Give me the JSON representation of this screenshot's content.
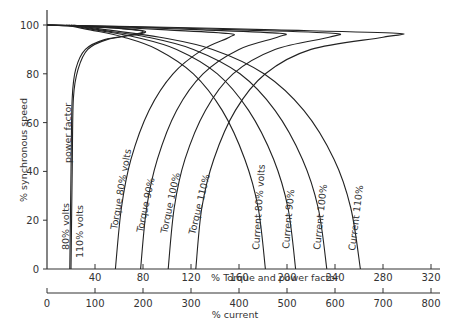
{
  "chart_data": {
    "type": "line",
    "title": "",
    "ylabel": "% synchronous speed",
    "xlabel": "% Torque and power factor",
    "xlabel2": "% current",
    "ylim": [
      0,
      100
    ],
    "xlim": [
      0,
      320
    ],
    "xlim2": [
      0,
      800
    ],
    "y_ticks": [
      "0",
      "20",
      "40",
      "60",
      "80",
      "100"
    ],
    "x_ticks": [
      "40",
      "80",
      "120",
      "160",
      "200",
      "240",
      "280",
      "320"
    ],
    "x2_ticks": [
      "0",
      "100",
      "200",
      "300",
      "400",
      "500",
      "600",
      "700",
      "800"
    ],
    "grid": false,
    "series": [
      {
        "name": "power factor 80% volts",
        "label": "80% volts",
        "axis": "torque",
        "points": [
          [
            19,
            0
          ],
          [
            20,
            40
          ],
          [
            21,
            70
          ],
          [
            24,
            82
          ],
          [
            32,
            90
          ],
          [
            48,
            94
          ],
          [
            80,
            97
          ],
          [
            60,
            98.6
          ],
          [
            20,
            99.6
          ],
          [
            0,
            100
          ]
        ]
      },
      {
        "name": "power factor 110% volts",
        "label": "110% volts",
        "axis": "torque",
        "points": [
          [
            20,
            0
          ],
          [
            21,
            40
          ],
          [
            22,
            70
          ],
          [
            26,
            82
          ],
          [
            34,
            90
          ],
          [
            50,
            94
          ],
          [
            82,
            97
          ],
          [
            62,
            98.6
          ],
          [
            22,
            99.6
          ],
          [
            0,
            100
          ]
        ]
      },
      {
        "name": "Torque 80% volts",
        "label": "Torque 80% volts",
        "axis": "torque",
        "points": [
          [
            57,
            0
          ],
          [
            62,
            25
          ],
          [
            70,
            45
          ],
          [
            85,
            65
          ],
          [
            105,
            80
          ],
          [
            130,
            90
          ],
          [
            152,
            95
          ],
          [
            151,
            96.5
          ],
          [
            100,
            98
          ],
          [
            40,
            99.4
          ],
          [
            0,
            100
          ]
        ]
      },
      {
        "name": "Torque 90% volts",
        "label": "Torque 90%",
        "axis": "torque",
        "points": [
          [
            78,
            0
          ],
          [
            83,
            25
          ],
          [
            92,
            45
          ],
          [
            108,
            65
          ],
          [
            130,
            80
          ],
          [
            160,
            90
          ],
          [
            192,
            95
          ],
          [
            194,
            96.6
          ],
          [
            130,
            98
          ],
          [
            50,
            99.4
          ],
          [
            0,
            100
          ]
        ]
      },
      {
        "name": "Torque 100% volts",
        "label": "Torque 100%",
        "axis": "torque",
        "points": [
          [
            101,
            0
          ],
          [
            106,
            25
          ],
          [
            115,
            45
          ],
          [
            132,
            65
          ],
          [
            155,
            80
          ],
          [
            190,
            90
          ],
          [
            235,
            95
          ],
          [
            238,
            96.6
          ],
          [
            160,
            98
          ],
          [
            60,
            99.4
          ],
          [
            0,
            100
          ]
        ]
      },
      {
        "name": "Torque 110% volts",
        "label": "Torque 110%",
        "axis": "torque",
        "points": [
          [
            124,
            0
          ],
          [
            129,
            25
          ],
          [
            139,
            45
          ],
          [
            157,
            65
          ],
          [
            182,
            80
          ],
          [
            220,
            90
          ],
          [
            280,
            95
          ],
          [
            291,
            96.6
          ],
          [
            190,
            98
          ],
          [
            70,
            99.4
          ],
          [
            0,
            100
          ]
        ]
      },
      {
        "name": "Current 80% volts",
        "label": "Current 80% volts",
        "axis": "current",
        "points": [
          [
            455,
            0
          ],
          [
            440,
            25
          ],
          [
            412,
            45
          ],
          [
            365,
            65
          ],
          [
            305,
            80
          ],
          [
            230,
            90
          ],
          [
            160,
            95
          ],
          [
            90,
            98
          ],
          [
            40,
            100
          ]
        ]
      },
      {
        "name": "Current 90% volts",
        "label": "Current 90%",
        "axis": "current",
        "points": [
          [
            518,
            0
          ],
          [
            502,
            25
          ],
          [
            472,
            45
          ],
          [
            420,
            65
          ],
          [
            355,
            80
          ],
          [
            270,
            90
          ],
          [
            185,
            95
          ],
          [
            100,
            98
          ],
          [
            45,
            100
          ]
        ]
      },
      {
        "name": "Current 100% volts",
        "label": "Current 100%",
        "axis": "current",
        "points": [
          [
            583,
            0
          ],
          [
            565,
            25
          ],
          [
            532,
            45
          ],
          [
            475,
            65
          ],
          [
            402,
            80
          ],
          [
            305,
            90
          ],
          [
            210,
            95
          ],
          [
            110,
            98
          ],
          [
            50,
            100
          ]
        ]
      },
      {
        "name": "Current 110% volts",
        "label": "Current 110%",
        "axis": "current",
        "points": [
          [
            653,
            0
          ],
          [
            633,
            25
          ],
          [
            598,
            45
          ],
          [
            535,
            65
          ],
          [
            452,
            80
          ],
          [
            345,
            90
          ],
          [
            235,
            95
          ],
          [
            125,
            98
          ],
          [
            55,
            100
          ]
        ]
      }
    ]
  }
}
